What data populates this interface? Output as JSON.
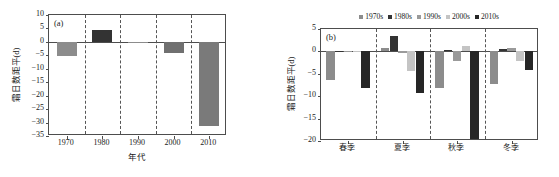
{
  "figure": {
    "background": "#ffffff",
    "axis_color": "#4d4d4d"
  },
  "chart_data": [
    {
      "id": "panel-a",
      "type": "bar",
      "panel_tag": "(a)",
      "title": "",
      "xlabel": "年代",
      "ylabel": "霜日数距平(d)",
      "categories": [
        "1970",
        "1980",
        "1990",
        "2000",
        "2010"
      ],
      "values": [
        -5.4,
        4.5,
        -0.6,
        -4.3,
        -31.3
      ],
      "bar_colors": [
        "#8c8c8c",
        "#333333",
        "#8c8c8c",
        "#707070",
        "#7a7a7a"
      ],
      "ylim": [
        -35,
        10
      ],
      "yticks": [
        10,
        5,
        0,
        -5,
        -10,
        -15,
        -20,
        -25,
        -30,
        -35
      ],
      "ytick_labels": [
        "10",
        "5",
        "0",
        "-5",
        "-10",
        "-15",
        "-20",
        "-25",
        "-30",
        "-35"
      ],
      "grid": false,
      "category_separators": true,
      "legend": null
    },
    {
      "id": "panel-b",
      "type": "bar",
      "panel_tag": "(b)",
      "title": "",
      "xlabel": "",
      "ylabel": "霜日数距平(d)",
      "categories": [
        "春季",
        "夏季",
        "秋季",
        "冬季"
      ],
      "series": [
        {
          "name": "1970s",
          "color": "#8c8c8c",
          "values": [
            -6.3,
            0.8,
            -8.2,
            -7.2
          ]
        },
        {
          "name": "1980s",
          "color": "#333333",
          "values": [
            -0.1,
            3.5,
            0.3,
            0.6
          ]
        },
        {
          "name": "1990s",
          "color": "#9a9a9a",
          "values": [
            -0.2,
            -0.3,
            -2.1,
            0.7
          ]
        },
        {
          "name": "2000s",
          "color": "#c4c4c4",
          "values": [
            0.1,
            -4.3,
            1.2,
            -2.2
          ]
        },
        {
          "name": "2010s",
          "color": "#262626",
          "values": [
            -8.2,
            -9.2,
            -20.4,
            -4.2
          ]
        }
      ],
      "ylim": [
        -20,
        5
      ],
      "yticks": [
        5,
        0,
        -5,
        -10,
        -15,
        -20
      ],
      "ytick_labels": [
        "5",
        "0",
        "-5",
        "-10",
        "-15",
        "-20"
      ],
      "grid": false,
      "category_separators": true,
      "legend": {
        "position": "top-center",
        "entries": [
          "1970s",
          "1980s",
          "1990s",
          "2000s",
          "2010s"
        ]
      }
    }
  ]
}
